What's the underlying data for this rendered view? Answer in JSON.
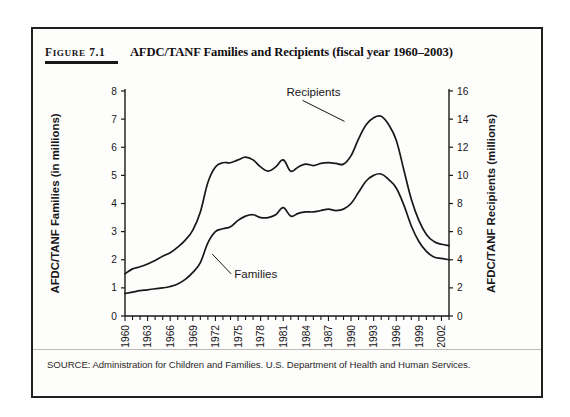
{
  "figure": {
    "number_prefix": "F",
    "number_rest": "IGURE",
    "number_value": "7.1",
    "title": "AFDC/TANF Families and Recipients (fiscal year 1960–2003)",
    "source": "SOURCE: Administration for Children and Families. U.S. Department of Health and Human Services."
  },
  "chart_data": {
    "type": "line",
    "title": "AFDC/TANF Families and Recipients (fiscal year 1960–2003)",
    "xlabel": "",
    "ylabel": "AFDC/TANF Families (in millions)",
    "y2label": "AFDC/TANF Recipients (millions)",
    "xlim": [
      1960,
      2003
    ],
    "ylim": [
      0,
      8
    ],
    "y2lim": [
      0,
      16
    ],
    "yticks": [
      0,
      1,
      2,
      3,
      4,
      5,
      6,
      7,
      8
    ],
    "y2ticks": [
      0,
      2,
      4,
      6,
      8,
      10,
      12,
      14,
      16
    ],
    "xticks": [
      1960,
      1963,
      1966,
      1969,
      1972,
      1975,
      1978,
      1981,
      1984,
      1987,
      1990,
      1993,
      1996,
      1999,
      2002
    ],
    "xtick_labels": [
      "1960",
      "1963",
      "1966",
      "1969",
      "1972",
      "1975",
      "1978",
      "1981",
      "1984",
      "1987",
      "1990",
      "1993",
      "1996",
      "1999",
      "2002"
    ],
    "xtick_minor_step": 1,
    "grid": false,
    "legend_position": "inline-annotations",
    "line_color": "#1a1718",
    "x": [
      1960,
      1961,
      1962,
      1963,
      1964,
      1965,
      1966,
      1967,
      1968,
      1969,
      1970,
      1971,
      1972,
      1973,
      1974,
      1975,
      1976,
      1977,
      1978,
      1979,
      1980,
      1981,
      1982,
      1983,
      1984,
      1985,
      1986,
      1987,
      1988,
      1989,
      1990,
      1991,
      1992,
      1993,
      1994,
      1995,
      1996,
      1997,
      1998,
      1999,
      2000,
      2001,
      2002,
      2003
    ],
    "series": [
      {
        "name": "Recipients",
        "axis": "right",
        "units": "millions",
        "annotation": "Recipients",
        "values": [
          3.0,
          3.35,
          3.5,
          3.7,
          3.95,
          4.25,
          4.5,
          4.9,
          5.4,
          6.1,
          7.4,
          9.5,
          10.6,
          10.9,
          10.9,
          11.1,
          11.3,
          11.1,
          10.6,
          10.3,
          10.6,
          11.1,
          10.3,
          10.6,
          10.8,
          10.7,
          10.85,
          10.9,
          10.85,
          10.8,
          11.4,
          12.6,
          13.6,
          14.1,
          14.2,
          13.6,
          12.5,
          10.4,
          8.3,
          6.8,
          5.8,
          5.3,
          5.1,
          5.0
        ]
      },
      {
        "name": "Families",
        "axis": "left",
        "units": "millions",
        "annotation": "Families",
        "values": [
          0.8,
          0.85,
          0.9,
          0.93,
          0.97,
          1.0,
          1.05,
          1.14,
          1.3,
          1.55,
          1.9,
          2.6,
          3.0,
          3.1,
          3.17,
          3.4,
          3.55,
          3.6,
          3.5,
          3.5,
          3.6,
          3.85,
          3.55,
          3.65,
          3.7,
          3.7,
          3.75,
          3.8,
          3.75,
          3.8,
          4.0,
          4.4,
          4.8,
          5.0,
          5.05,
          4.85,
          4.55,
          3.95,
          3.2,
          2.65,
          2.3,
          2.1,
          2.05,
          2.0
        ]
      }
    ]
  }
}
